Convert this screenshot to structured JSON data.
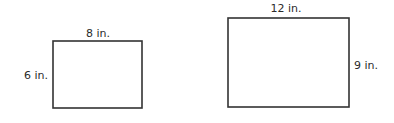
{
  "figures": [
    {
      "name": "small-rectangle",
      "width_label": "8 in.",
      "height_label": "6 in.",
      "width": 8,
      "height": 6,
      "unit": "in."
    },
    {
      "name": "large-rectangle",
      "width_label": "12 in.",
      "height_label": "9 in.",
      "width": 12,
      "height": 9,
      "unit": "in."
    }
  ],
  "colors": {
    "stroke": "#333333",
    "text": "#2b2b2b",
    "background": "#ffffff"
  }
}
